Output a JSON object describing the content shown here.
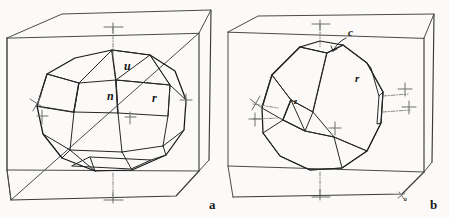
{
  "figure": {
    "background_color": "#fbfaf8",
    "ink_color": "#161616",
    "cube_color": "#4a4a4a",
    "axis_color": "#7b7b7b"
  },
  "panels": [
    {
      "id": "a",
      "label": "a",
      "caption_label": "a",
      "description": "crystal drawing in reference cube",
      "face_labels": [
        {
          "text": "u",
          "x": 124,
          "y": 70
        },
        {
          "text": "n",
          "x": 107,
          "y": 100
        },
        {
          "text": "r",
          "x": 152,
          "y": 102
        }
      ],
      "axis_markers": 5
    },
    {
      "id": "b",
      "label": "b",
      "caption_label": "b",
      "description": "crystal drawing in reference cube",
      "face_labels": [
        {
          "text": "c",
          "x": 348,
          "y": 36
        },
        {
          "text": "r",
          "x": 355,
          "y": 82
        },
        {
          "text": "z",
          "x": 320,
          "y": 100
        }
      ],
      "edge_label": {
        "text": "a",
        "x": 404,
        "y": 201
      },
      "axis_markers": 6
    }
  ]
}
